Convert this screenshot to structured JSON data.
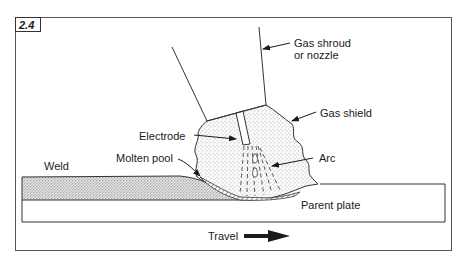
{
  "figure": {
    "number": "2.4"
  },
  "labels": {
    "gas_shroud_line1": "Gas shroud",
    "gas_shroud_line2": "or nozzle",
    "gas_shield": "Gas shield",
    "electrode": "Electrode",
    "arc": "Arc",
    "weld": "Weld",
    "molten_pool": "Molten pool",
    "parent_plate": "Parent plate",
    "travel": "Travel"
  },
  "colors": {
    "line": "#2a2a2a",
    "stipple": "#8a8a8a",
    "background": "#ffffff",
    "frame": "#555555"
  }
}
